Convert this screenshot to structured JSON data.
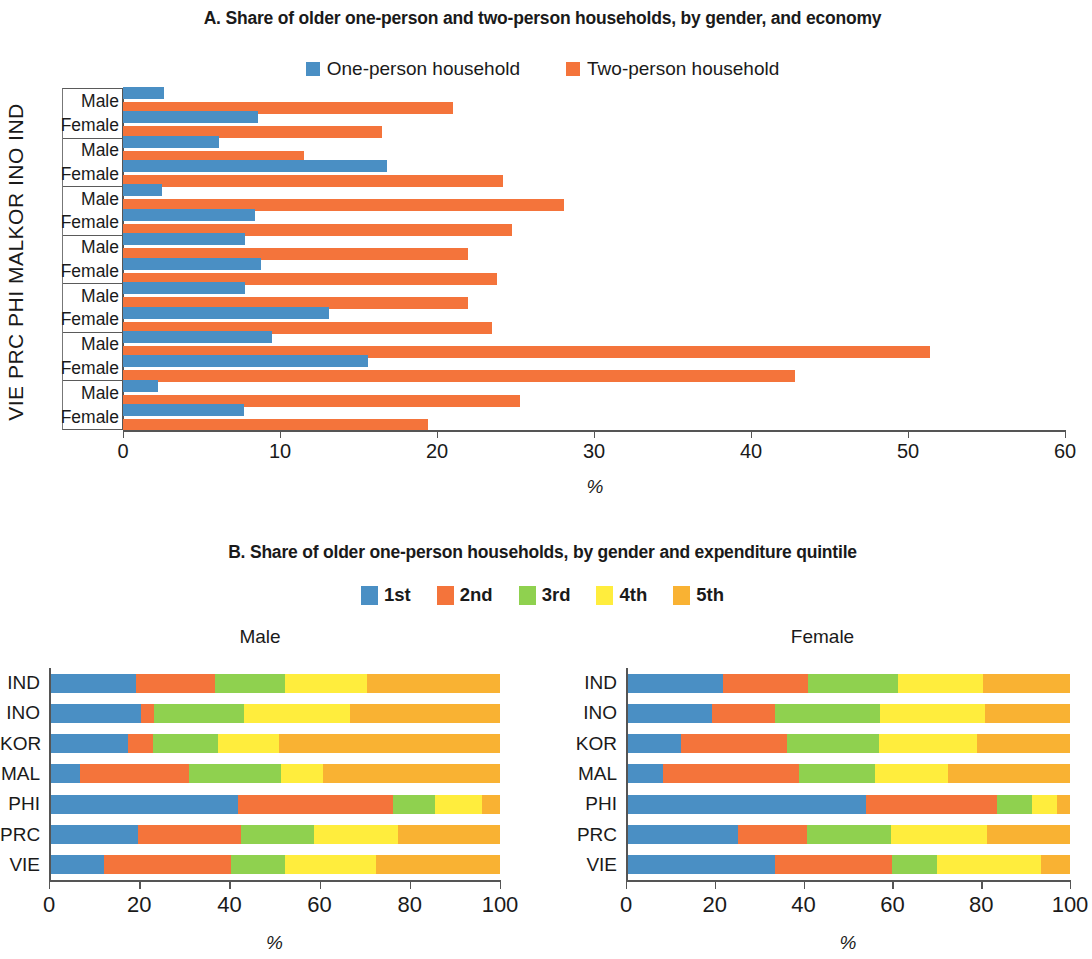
{
  "colors": {
    "blue": "#4a8fc4",
    "orange": "#f4743b",
    "green": "#8fd14f",
    "yellow": "#ffed3d",
    "amber": "#f9b233",
    "axis": "#555555"
  },
  "chart_a": {
    "title": "A. Share of older one-person and two-person households, by gender, and economy",
    "legend": [
      {
        "label": "One-person household",
        "color": "#4a8fc4"
      },
      {
        "label": "Two-person household",
        "color": "#f4743b"
      }
    ],
    "ylabel": "VIE PRC PHI MALKOR INO IND",
    "xlabel": "%",
    "xticks": [
      0,
      10,
      20,
      30,
      40,
      50,
      60
    ],
    "row_labels": [
      "Male",
      "Female"
    ]
  },
  "chart_b": {
    "title": "B. Share of older one-person households, by gender and expenditure quintile",
    "legend": [
      {
        "label": "1st",
        "color": "#4a8fc4"
      },
      {
        "label": "2nd",
        "color": "#f4743b"
      },
      {
        "label": "3rd",
        "color": "#8fd14f"
      },
      {
        "label": "4th",
        "color": "#ffed3d"
      },
      {
        "label": "5th",
        "color": "#f9b233"
      }
    ],
    "panels": [
      "Male",
      "Female"
    ],
    "xlabel": "%",
    "xticks": [
      0,
      20,
      40,
      60,
      80,
      100
    ]
  },
  "chart_data": [
    {
      "type": "bar",
      "orientation": "horizontal",
      "title": "A. Share of older one-person and two-person households, by gender, and economy",
      "xlabel": "%",
      "ylabel": "Economy / Gender",
      "xlim": [
        0,
        60
      ],
      "xticks": [
        0,
        10,
        20,
        30,
        40,
        50,
        60
      ],
      "grid": false,
      "legend_position": "top",
      "categories": [
        "IND Male",
        "IND Female",
        "INO Male",
        "INO Female",
        "KOR Male",
        "KOR Female",
        "MAL Male",
        "MAL Female",
        "PHI Male",
        "PHI Female",
        "PRC Male",
        "PRC Female",
        "VIE Male",
        "VIE Female"
      ],
      "economies": [
        "IND",
        "INO",
        "KOR",
        "MAL",
        "PHI",
        "PRC",
        "VIE"
      ],
      "series": [
        {
          "name": "One-person household",
          "color": "#4a8fc4",
          "values": [
            2.6,
            8.6,
            6.1,
            16.8,
            2.5,
            8.4,
            7.8,
            8.8,
            7.8,
            13.1,
            9.5,
            15.6,
            2.2,
            7.7
          ]
        },
        {
          "name": "Two-person household",
          "color": "#f4743b",
          "values": [
            21.0,
            16.5,
            11.5,
            24.2,
            28.1,
            24.8,
            22.0,
            23.8,
            22.0,
            23.5,
            51.4,
            42.8,
            25.3,
            19.4
          ]
        }
      ]
    },
    {
      "type": "bar",
      "subtype": "stacked-100",
      "orientation": "horizontal",
      "title": "B. Share of older one-person households, by gender and expenditure quintile — Male",
      "panel": "Male",
      "xlabel": "%",
      "xlim": [
        0,
        100
      ],
      "xticks": [
        0,
        20,
        40,
        60,
        80,
        100
      ],
      "grid": false,
      "legend_position": "top",
      "categories": [
        "IND",
        "INO",
        "KOR",
        "MAL",
        "PHI",
        "PRC",
        "VIE"
      ],
      "series": [
        {
          "name": "1st",
          "color": "#4a8fc4",
          "values": [
            19.3,
            20.3,
            17.5,
            6.8,
            42.0,
            19.8,
            12.3
          ]
        },
        {
          "name": "2nd",
          "color": "#f4743b",
          "values": [
            17.5,
            3.0,
            5.5,
            24.3,
            34.3,
            22.7,
            28.0
          ]
        },
        {
          "name": "3rd",
          "color": "#8fd14f",
          "values": [
            15.5,
            20.0,
            14.4,
            20.4,
            9.3,
            16.2,
            12.0
          ]
        },
        {
          "name": "4th",
          "color": "#ffed3d",
          "values": [
            18.2,
            23.4,
            13.6,
            9.3,
            10.4,
            18.6,
            20.2
          ]
        },
        {
          "name": "5th",
          "color": "#f9b233",
          "values": [
            29.5,
            33.3,
            49.0,
            39.2,
            4.0,
            22.7,
            27.5
          ]
        }
      ]
    },
    {
      "type": "bar",
      "subtype": "stacked-100",
      "orientation": "horizontal",
      "title": "B. Share of older one-person households, by gender and expenditure quintile — Female",
      "panel": "Female",
      "xlabel": "%",
      "xlim": [
        0,
        100
      ],
      "xticks": [
        0,
        20,
        40,
        60,
        80,
        100
      ],
      "grid": false,
      "legend_position": "top",
      "categories": [
        "IND",
        "INO",
        "KOR",
        "MAL",
        "PHI",
        "PRC",
        "VIE"
      ],
      "series": [
        {
          "name": "1st",
          "color": "#4a8fc4",
          "values": [
            21.8,
            19.3,
            12.3,
            8.4,
            54.0,
            25.3,
            33.5
          ]
        },
        {
          "name": "2nd",
          "color": "#f4743b",
          "values": [
            19.2,
            14.2,
            24.0,
            30.6,
            29.5,
            15.4,
            26.5
          ]
        },
        {
          "name": "3rd",
          "color": "#8fd14f",
          "values": [
            20.3,
            23.8,
            20.7,
            17.0,
            8.0,
            18.9,
            10.0
          ]
        },
        {
          "name": "4th",
          "color": "#ffed3d",
          "values": [
            19.1,
            23.5,
            22.0,
            16.6,
            5.5,
            21.6,
            23.5
          ]
        },
        {
          "name": "5th",
          "color": "#f9b233",
          "values": [
            19.6,
            19.2,
            21.0,
            27.4,
            3.0,
            18.8,
            6.5
          ]
        }
      ]
    }
  ]
}
